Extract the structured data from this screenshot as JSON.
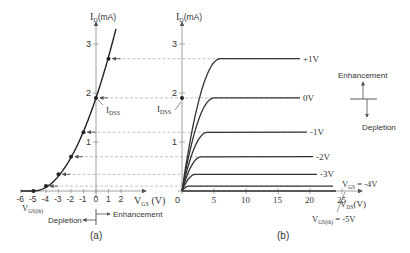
{
  "left_plot": {
    "y_label": "I",
    "y_label_sub": "D",
    "y_label_unit": "(mA)",
    "x_label": "V",
    "x_label_sub": "GS",
    "x_label_unit": " (V)",
    "x_ticks": [
      "-6",
      "-5",
      "-4",
      "-3",
      "-2",
      "-1",
      "0",
      "1",
      "2"
    ],
    "y_ticks": [
      "1",
      "2",
      "3"
    ],
    "idss_label": "I",
    "idss_sub": "DSS",
    "vgs_th_label": "V",
    "vgs_th_sub": "GS(th)",
    "depletion_label": "Depletion",
    "enhancement_label": "Enhancement",
    "caption": "(a)"
  },
  "right_plot": {
    "y_label": "I",
    "y_label_sub": "D",
    "y_label_unit": "(mA)",
    "x_label": "V",
    "x_label_sub": "DS",
    "x_label_unit": "(V)",
    "x_ticks": [
      "0",
      "5",
      "10",
      "15",
      "20",
      "25"
    ],
    "y_ticks": [
      "1",
      "2",
      "3"
    ],
    "idss_label": "I",
    "idss_sub": "DSS",
    "curve_labels": [
      "+1V",
      "0V",
      "-1V",
      "-2V",
      "-3V"
    ],
    "vgs4_label": "V",
    "vgs4_sub": "GS",
    "vgs4_value": " = -4V",
    "vgs_th_label": "V",
    "vgs_th_sub": "GS(th)",
    "vgs_th_value": " = -5V",
    "enhancement_label": "Enhancement",
    "depletion_label": "Depletion",
    "caption": "(b)"
  },
  "chart_data": {
    "type": "line",
    "transfer_curve": {
      "vgs": [
        -5,
        -4,
        -3,
        -2,
        -1,
        0,
        1
      ],
      "id_ma": [
        0,
        0.1,
        0.34,
        0.7,
        1.2,
        1.9,
        2.7
      ]
    },
    "output_curves": [
      {
        "vgs": "+1V",
        "id_sat_ma": 2.7
      },
      {
        "vgs": "0V",
        "id_sat_ma": 1.9
      },
      {
        "vgs": "-1V",
        "id_sat_ma": 1.2
      },
      {
        "vgs": "-2V",
        "id_sat_ma": 0.7
      },
      {
        "vgs": "-3V",
        "id_sat_ma": 0.34
      },
      {
        "vgs": "-4V",
        "id_sat_ma": 0.1
      },
      {
        "vgs": "-5V",
        "id_sat_ma": 0
      }
    ],
    "x_range_left": [
      -6,
      2
    ],
    "y_range": [
      0,
      3.3
    ],
    "x_range_right": [
      0,
      28
    ]
  }
}
